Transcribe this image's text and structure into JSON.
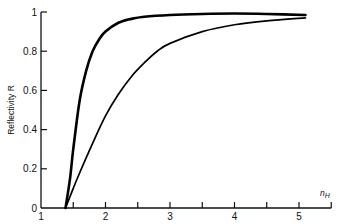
{
  "chart_data": {
    "type": "line",
    "title": "",
    "xlabel": "n_H",
    "xlabel_main": "n",
    "xlabel_sub": "H",
    "ylabel": "Reflectivity R",
    "xlim": [
      1,
      5.5
    ],
    "ylim": [
      0,
      1
    ],
    "x_ticks": [
      1,
      1.5,
      2,
      2.5,
      3,
      3.5,
      4,
      4.5,
      5,
      5.5
    ],
    "x_tick_labels": [
      "1",
      "",
      "2",
      "",
      "3",
      "",
      "4",
      "",
      "5",
      ""
    ],
    "y_ticks": [
      0,
      0.2,
      0.4,
      0.6,
      0.8,
      1
    ],
    "y_tick_labels": [
      "0",
      "0.2",
      "0.4",
      "0.6",
      "0.8",
      "1"
    ],
    "grid": false,
    "legend": "none",
    "series": [
      {
        "name": "upper curve (bold)",
        "style": "bold",
        "x": [
          1.38,
          1.45,
          1.5,
          1.6,
          1.7,
          1.8,
          1.9,
          2.0,
          2.2,
          2.4,
          2.6,
          3.0,
          3.5,
          4.0,
          4.5,
          5.1
        ],
        "y": [
          0.0,
          0.15,
          0.3,
          0.55,
          0.7,
          0.8,
          0.86,
          0.9,
          0.945,
          0.965,
          0.976,
          0.985,
          0.99,
          0.992,
          0.99,
          0.985
        ]
      },
      {
        "name": "lower curve (thin)",
        "style": "thin",
        "x": [
          1.38,
          1.5,
          1.6,
          1.8,
          2.0,
          2.2,
          2.4,
          2.6,
          2.8,
          3.0,
          3.5,
          4.0,
          4.5,
          5.1
        ],
        "y": [
          0.0,
          0.1,
          0.18,
          0.33,
          0.47,
          0.58,
          0.67,
          0.74,
          0.8,
          0.84,
          0.9,
          0.935,
          0.955,
          0.97
        ]
      }
    ]
  }
}
